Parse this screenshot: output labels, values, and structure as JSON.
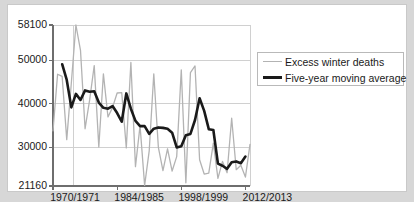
{
  "chart_data": {
    "type": "line",
    "title": "",
    "subtitle": "",
    "xlabel": "",
    "ylabel": "",
    "grid": true,
    "legend_position": "right",
    "ylim": [
      21160,
      58100
    ],
    "ytick_labels": [
      "58100",
      "50000",
      "40000",
      "30000",
      "21160"
    ],
    "ytick_values": [
      58100,
      50000,
      40000,
      30000,
      21160
    ],
    "xtick_labels": [
      "1970/1971",
      "1984/1985",
      "1998/1999",
      "2012/2013"
    ],
    "xtick_values": [
      1970,
      1984,
      1998,
      2012
    ],
    "xlim": [
      1970,
      2013
    ],
    "x": [
      1970,
      1971,
      1972,
      1973,
      1974,
      1975,
      1976,
      1977,
      1978,
      1979,
      1980,
      1981,
      1982,
      1983,
      1984,
      1985,
      1986,
      1987,
      1988,
      1989,
      1990,
      1991,
      1992,
      1993,
      1994,
      1995,
      1996,
      1997,
      1998,
      1999,
      2000,
      2001,
      2002,
      2003,
      2004,
      2005,
      2006,
      2007,
      2008,
      2009,
      2010,
      2011,
      2012,
      2013
    ],
    "series": [
      {
        "name": "Excess winter deaths",
        "color": "#b3b3b3",
        "width": 1.3,
        "values": [
          33800,
          46800,
          46300,
          31800,
          44800,
          58100,
          52300,
          34300,
          40900,
          48800,
          30100,
          46900,
          37000,
          39200,
          42500,
          42600,
          29900,
          49500,
          25600,
          35000,
          21300,
          29200,
          46900,
          30000,
          24700,
          29700,
          24600,
          27900,
          47800,
          21900,
          47200,
          48700,
          27200,
          23900,
          24100,
          31000,
          22900,
          26800,
          24200,
          36700,
          24900,
          25900,
          23200,
          30700
        ]
      },
      {
        "name": "Five-year moving average",
        "color": "#1a1a1a",
        "width": 2.6,
        "values": [
          null,
          null,
          49100,
          45500,
          39200,
          42300,
          40900,
          43100,
          42800,
          42900,
          40300,
          39100,
          38900,
          39500,
          37900,
          35900,
          42400,
          38900,
          36100,
          34900,
          34900,
          33100,
          34300,
          34600,
          34500,
          34300,
          33400,
          30000,
          30300,
          32800,
          33100,
          36300,
          41300,
          38400,
          34200,
          34000,
          26300,
          25800,
          25100,
          26600,
          26800,
          26400,
          27900,
          null
        ]
      }
    ]
  },
  "axis": {
    "ytick_positions_px": [
      20,
      52,
      95,
      138,
      181
    ],
    "xtick_positions_px": [
      47,
      91,
      135,
      180
    ]
  },
  "legend": {
    "items": [
      {
        "label": "Excess winter deaths",
        "style": "thin",
        "color": "#b3b3b3"
      },
      {
        "label": "Five-year moving average",
        "style": "thick",
        "color": "#1a1a1a"
      }
    ]
  },
  "colors": {
    "page_background": "#d7d7d7",
    "panel_background": "#ffffff",
    "panel_border": "#c9c9c9",
    "grid": "#d0d0d0",
    "axis": "#6e6e6e",
    "text": "#1a1a1a"
  }
}
